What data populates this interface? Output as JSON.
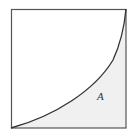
{
  "diagram": {
    "region_label": "A",
    "colors": {
      "border": "#555555",
      "curve": "#333333",
      "shade": "#f0f0f0",
      "background": "#ffffff"
    }
  }
}
